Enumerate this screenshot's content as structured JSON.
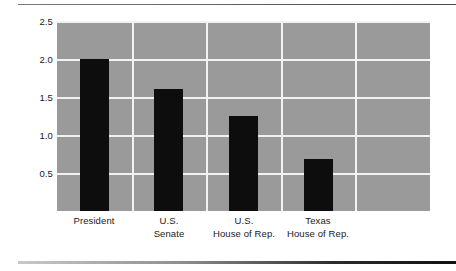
{
  "chart_data": {
    "type": "bar",
    "title": "",
    "subtitle": "",
    "xlabel": "",
    "ylabel": "Vote (in millions)",
    "categories": [
      "President",
      "U.S. Senate",
      "U.S. House of Rep.",
      "Texas House of Rep."
    ],
    "category_lines": [
      [
        "President"
      ],
      [
        "U.S.",
        "Senate"
      ],
      [
        "U.S.",
        "House of Rep."
      ],
      [
        "Texas",
        "House of Rep."
      ]
    ],
    "values": [
      2.0,
      1.6,
      1.25,
      0.68
    ],
    "ylim": [
      0,
      2.5
    ],
    "ytick_labels": [
      "2.5",
      "2.0",
      "1.5",
      "1.0",
      "0.5"
    ],
    "ytick_values": [
      2.5,
      2.0,
      1.5,
      1.0,
      0.5
    ],
    "ytick_interval": 0.5,
    "grid": true,
    "grid_orientation": "both",
    "vertical_grid_count": 4,
    "legend": null,
    "legend_position": "none",
    "colors": {
      "bar": "#0d0d0d",
      "plot_background": "#9a9a9a",
      "gridline": "#f2f2f2",
      "page_background": "#ffffff",
      "text": "#1a1a1a",
      "rule": "#111111"
    }
  }
}
